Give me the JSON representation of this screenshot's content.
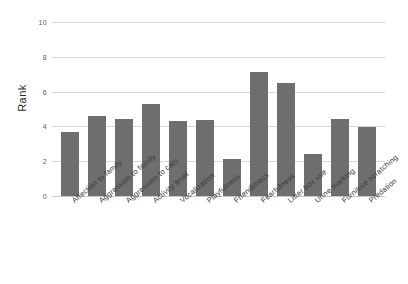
{
  "chart_data": {
    "type": "bar",
    "title": "",
    "xlabel": "",
    "ylabel": "Rank",
    "ylim": [
      0,
      10
    ],
    "yticks": [
      0,
      2,
      4,
      6,
      8,
      10
    ],
    "grid": true,
    "legend": null,
    "bar_color": "#6e6e6e",
    "grid_color": "#d8d8d8",
    "categories": [
      "Affection to family",
      "Aggression to family",
      "Aggression to cats",
      "Activity level",
      "Vocalization",
      "Playfulness",
      "Friendliness",
      "Fearfulness",
      "Litter box use",
      "Urine marking",
      "Furniture scratching",
      "Predation"
    ],
    "values": [
      3.7,
      4.6,
      4.45,
      5.3,
      4.3,
      4.35,
      2.15,
      7.1,
      6.5,
      2.4,
      4.45,
      3.95
    ]
  }
}
